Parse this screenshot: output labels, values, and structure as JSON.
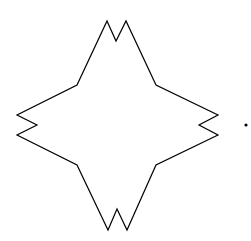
{
  "figure": {
    "background": "#ffffff",
    "stroke_color": "#000000",
    "stroke_width": 1.2,
    "star_shape": {
      "label": "four-pointed star with notched tips",
      "points": [
        [
          107,
          21
        ],
        [
          116,
          41
        ],
        [
          126,
          21
        ],
        [
          156,
          85
        ],
        [
          218,
          115
        ],
        [
          199,
          125
        ],
        [
          218,
          135
        ],
        [
          156,
          165
        ],
        [
          127,
          230
        ],
        [
          117,
          209
        ],
        [
          108,
          230
        ],
        [
          77,
          165
        ],
        [
          17,
          135
        ],
        [
          37,
          125
        ],
        [
          17,
          115
        ],
        [
          77,
          85
        ]
      ]
    },
    "dot": {
      "cx": 246,
      "cy": 125,
      "r": 1.6,
      "fill": "#000000"
    }
  }
}
